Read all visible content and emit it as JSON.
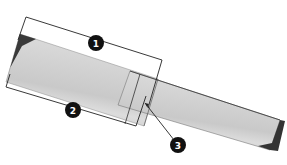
{
  "diagram": {
    "colors": {
      "board_fill": "#c8c8c8",
      "board_highlight": "#dedede",
      "end_grain": "#3a3a3a",
      "line": "#222222",
      "callout_fill": "#111111",
      "callout_text": "#ffffff"
    },
    "callouts": [
      {
        "id": "1",
        "label": "1",
        "x": 96,
        "y": 43
      },
      {
        "id": "2",
        "label": "2",
        "x": 73,
        "y": 110
      },
      {
        "id": "3",
        "label": "3",
        "x": 178,
        "y": 145
      }
    ]
  }
}
